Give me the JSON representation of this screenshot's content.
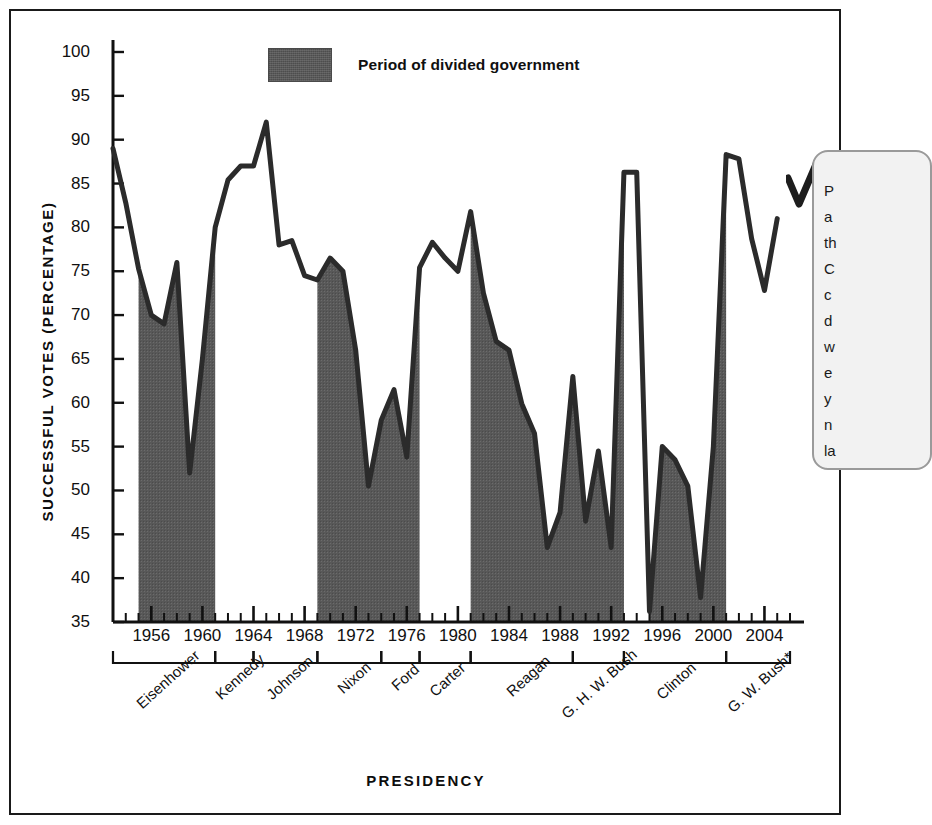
{
  "figure": {
    "frame_color": "#1a1a1a",
    "background": "#ffffff"
  },
  "legend": {
    "label": "Period of divided government",
    "swatch_color": "#585858"
  },
  "callout": {
    "visible_text": "P\na\nth\nC\nc\nd\nw\ne\ny\nn\nla",
    "note": "text clipped by right edge of screenshot"
  },
  "axes": {
    "y_title": "SUCCESSFUL VOTES (PERCENTAGE)",
    "x_title": "PRESIDENCY"
  },
  "presidencies": [
    {
      "name": "Eisenhower",
      "start": 1953,
      "end": 1961
    },
    {
      "name": "Kennedy",
      "start": 1961,
      "end": 1964
    },
    {
      "name": "Johnson",
      "start": 1964,
      "end": 1969
    },
    {
      "name": "Nixon",
      "start": 1969,
      "end": 1974
    },
    {
      "name": "Ford",
      "start": 1974,
      "end": 1977
    },
    {
      "name": "Carter",
      "start": 1977,
      "end": 1981
    },
    {
      "name": "Reagan",
      "start": 1981,
      "end": 1989
    },
    {
      "name": "G. H. W. Bush",
      "start": 1989,
      "end": 1993
    },
    {
      "name": "Clinton",
      "start": 1993,
      "end": 2001
    },
    {
      "name": "G. W. Bush*",
      "start": 2001,
      "end": 2006
    }
  ],
  "divided_government_periods": [
    {
      "start": 1955,
      "end": 1961
    },
    {
      "start": 1969,
      "end": 1977
    },
    {
      "start": 1981,
      "end": 1993
    },
    {
      "start": 1995,
      "end": 2001
    }
  ],
  "chart_data": {
    "type": "area",
    "title": "",
    "xlabel": "PRESIDENCY",
    "ylabel": "SUCCESSFUL VOTES (PERCENTAGE)",
    "xlim": [
      1953,
      2006
    ],
    "ylim": [
      35,
      100
    ],
    "ytick_values": [
      35,
      40,
      45,
      50,
      55,
      60,
      65,
      70,
      75,
      80,
      85,
      90,
      95,
      100
    ],
    "xtick_values": [
      1956,
      1960,
      1964,
      1968,
      1972,
      1976,
      1980,
      1984,
      1988,
      1992,
      1996,
      2000,
      2004
    ],
    "minor_tick_interval": 1,
    "grid": false,
    "legend_position": "top-center",
    "series": [
      {
        "name": "Successful votes (percentage)",
        "line_color": "#2b2b2b",
        "fill_color": "#585858",
        "fill_condition": "divided government years only",
        "x": [
          1953,
          1954,
          1955,
          1956,
          1957,
          1958,
          1959,
          1960,
          1961,
          1962,
          1963,
          1964,
          1965,
          1966,
          1967,
          1968,
          1969,
          1970,
          1971,
          1972,
          1973,
          1974,
          1975,
          1976,
          1977,
          1978,
          1979,
          1980,
          1981,
          1982,
          1983,
          1984,
          1985,
          1986,
          1987,
          1988,
          1989,
          1990,
          1991,
          1992,
          1993,
          1994,
          1995,
          1996,
          1997,
          1998,
          1999,
          2000,
          2001,
          2002,
          2003,
          2004,
          2005
        ],
        "y": [
          89.0,
          82.8,
          75.3,
          70.0,
          69.0,
          76.0,
          52.0,
          65.0,
          80.0,
          85.4,
          87.0,
          87.0,
          92.0,
          78.0,
          78.5,
          74.5,
          74.0,
          76.5,
          75.0,
          66.0,
          50.5,
          58.0,
          61.5,
          53.8,
          75.4,
          78.3,
          76.5,
          75.0,
          81.8,
          72.5,
          67.0,
          66.0,
          59.9,
          56.5,
          43.5,
          47.5,
          63.0,
          46.5,
          54.5,
          43.5,
          86.3,
          86.3,
          36.2,
          55.0,
          53.5,
          50.5,
          37.8,
          55.0,
          88.3,
          87.8,
          78.7,
          72.8,
          81.0
        ]
      }
    ]
  }
}
